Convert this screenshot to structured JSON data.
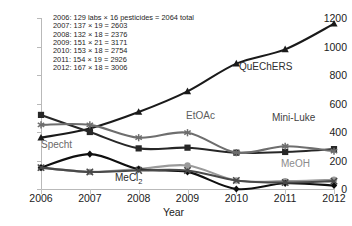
{
  "chart_data": {
    "type": "line",
    "title": "",
    "xlabel": "Year",
    "ylabel": "",
    "categories": [
      "2006",
      "2007",
      "2008",
      "2009",
      "2010",
      "2011",
      "2012"
    ],
    "x": [
      2006,
      2007,
      2008,
      2009,
      2010,
      2011,
      2012
    ],
    "xlim": [
      2006,
      2012
    ],
    "ylim": [
      0,
      1200
    ],
    "yticks": [
      "0",
      "200",
      "400",
      "600",
      "800",
      "1000",
      "1200"
    ],
    "ytick_values": [
      0,
      200,
      400,
      600,
      800,
      1000,
      1200
    ],
    "grid": false,
    "legend": "inline-labels",
    "series": [
      {
        "name": "QuEChERS",
        "marker": "triangle",
        "color": "#1a1a1a",
        "values": [
          360,
          425,
          540,
          685,
          880,
          980,
          1160
        ]
      },
      {
        "name": "Mini-Luke",
        "marker": "square",
        "color": "#272727",
        "values": [
          520,
          400,
          285,
          290,
          255,
          260,
          280
        ]
      },
      {
        "name": "EtOAc",
        "marker": "asterisk",
        "color": "#6e6e6e",
        "values": [
          450,
          450,
          360,
          395,
          255,
          300,
          265
        ]
      },
      {
        "name": "MeOH",
        "marker": "circle",
        "color": "#9a9a9a",
        "values": [
          150,
          120,
          140,
          165,
          60,
          55,
          65
        ]
      },
      {
        "name": "Specht",
        "marker": "diamond",
        "color": "#0f0f0f",
        "values": [
          150,
          245,
          140,
          120,
          0,
          40,
          25
        ]
      },
      {
        "name": "MeCl2",
        "marker": "cross",
        "color": "#4a4a4a",
        "values": [
          150,
          120,
          130,
          130,
          60,
          45,
          55
        ]
      }
    ],
    "annotations": [
      "2006: 129 labs × 16 pesticides = 2064 total",
      "2007: 137 × 19 = 2603",
      "2008: 132 × 18 = 2376",
      "2009: 151 × 21 = 3171",
      "2010: 153 × 18 = 2754",
      "2011: 154 × 19 = 2926",
      "2012: 167 × 18 = 3006"
    ],
    "series_labels": {
      "quechers": "QuEChERS",
      "etoac": "EtOAc",
      "mini_luke": "Mini-Luke",
      "specht": "Specht",
      "mecl2_prefix": "MeCl",
      "mecl2_subscript": "2",
      "meoh": "MeOH"
    }
  }
}
